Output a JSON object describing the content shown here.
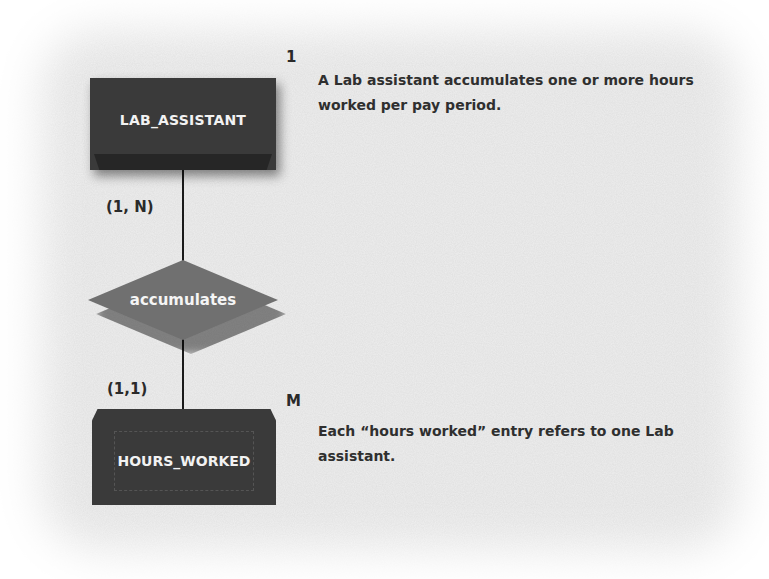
{
  "diagram": {
    "type": "ER diagram (Chen notation with cardinality)",
    "entities": [
      {
        "id": "lab_assistant",
        "label": "LAB_ASSISTANT",
        "cardinality_marker": "1",
        "participation": "(1, N)"
      },
      {
        "id": "hours_worked",
        "label": "HOURS_WORKED",
        "weak": true,
        "cardinality_marker": "M",
        "participation": "(1,1)"
      }
    ],
    "relationship": {
      "label": "accumulates"
    },
    "descriptions": {
      "top": "A Lab assistant accumulates one or more hours worked per pay period.",
      "bottom": "Each “hours worked” entry refers to one Lab assistant."
    }
  },
  "colors": {
    "entity_fill": "#3a3a3a",
    "relationship_fill": "#707070",
    "text": "#2f2f2f",
    "background": "#efefef"
  }
}
